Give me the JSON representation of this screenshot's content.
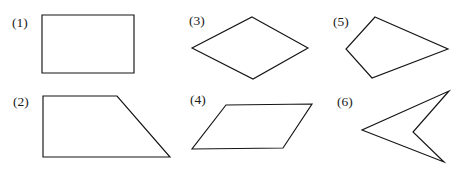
{
  "figure": {
    "width": 464,
    "height": 171,
    "background_color": "#ffffff",
    "stroke_color": "#141414",
    "label_color": "#1a1a1a",
    "fill_color": "#ffffff",
    "stroke_width": 1.15
  },
  "shapes": [
    {
      "id": "shape-1",
      "label": "(1)",
      "name": "rectangle",
      "label_x": 12,
      "label_y": 27,
      "points": "42,15 134,15 134,73 42,73",
      "closed": true,
      "vertex_count": 4
    },
    {
      "id": "shape-2",
      "label": "(2)",
      "name": "trapezoid",
      "label_x": 13,
      "label_y": 106,
      "points": "43,96 117,96 170,157 43,157",
      "closed": true,
      "vertex_count": 4
    },
    {
      "id": "shape-3",
      "label": "(3)",
      "name": "rhombus",
      "label_x": 189,
      "label_y": 25,
      "points": "252,17 308,48 253,79 192,48",
      "closed": true,
      "vertex_count": 4
    },
    {
      "id": "shape-4",
      "label": "(4)",
      "name": "parallelogram",
      "label_x": 190,
      "label_y": 104,
      "points": "226,105 312,104 283,148 192,149",
      "closed": true,
      "vertex_count": 4
    },
    {
      "id": "shape-5",
      "label": "(5)",
      "name": "kite",
      "label_x": 333,
      "label_y": 26,
      "points": "375,17 448,49 372,78 346,49",
      "closed": true,
      "vertex_count": 4
    },
    {
      "id": "shape-6",
      "label": "(6)",
      "name": "concave-dart",
      "label_x": 337,
      "label_y": 106,
      "points": "449,91 413,132 444,162 362,130",
      "closed": true,
      "vertex_count": 4
    }
  ]
}
